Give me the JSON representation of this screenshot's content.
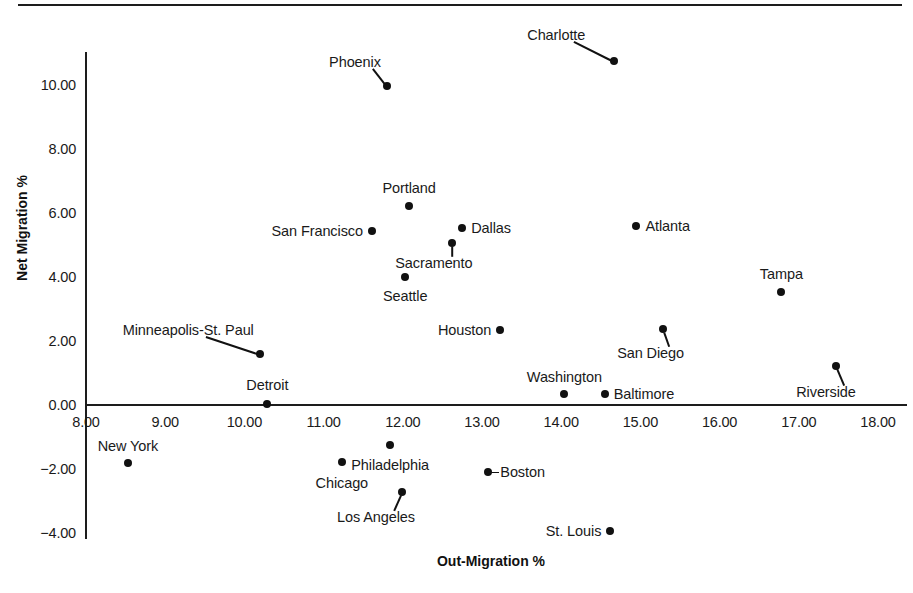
{
  "figure": {
    "title": "",
    "x_axis_title": "Out-Migration %",
    "y_axis_title": "Net Migration %"
  },
  "axes": {
    "x_ticks": [
      "8.00",
      "9.00",
      "10.00",
      "11.00",
      "12.00",
      "13.00",
      "14.00",
      "15.00",
      "16.00",
      "17.00",
      "18.00"
    ],
    "y_ticks": [
      "10.00",
      "8.00",
      "6.00",
      "4.00",
      "2.00",
      "0.00",
      "-2.00",
      "-4.00"
    ]
  },
  "colors": {
    "ink": "#111111",
    "background": "#ffffff"
  },
  "chart_data": {
    "type": "scatter",
    "title": "",
    "xlabel": "Out-Migration %",
    "ylabel": "Net Migration %",
    "xlim": [
      8.0,
      18.0
    ],
    "ylim": [
      -4.0,
      11.2
    ],
    "grid": false,
    "legend": "none",
    "xticks": [
      8.0,
      9.0,
      10.0,
      11.0,
      12.0,
      13.0,
      14.0,
      15.0,
      16.0,
      17.0,
      18.0
    ],
    "yticks": [
      -4.0,
      -2.0,
      0.0,
      2.0,
      4.0,
      6.0,
      8.0,
      10.0
    ],
    "points": [
      {
        "label": "Charlotte",
        "x": 14.67,
        "y": 10.75,
        "label_pos": "leader",
        "label_dx": -58,
        "label_dy": -26
      },
      {
        "label": "Phoenix",
        "x": 11.8,
        "y": 9.98,
        "label_pos": "leader",
        "label_dx": -32,
        "label_dy": -24
      },
      {
        "label": "Portland",
        "x": 12.08,
        "y": 6.22,
        "label_pos": "above",
        "label_dx": 0,
        "label_dy": -18
      },
      {
        "label": "Atlanta",
        "x": 14.95,
        "y": 5.6,
        "label_pos": "right",
        "label_dx": 9,
        "label_dy": 0
      },
      {
        "label": "Dallas",
        "x": 12.75,
        "y": 5.53,
        "label_pos": "right",
        "label_dx": 9,
        "label_dy": 0
      },
      {
        "label": "San Francisco",
        "x": 11.61,
        "y": 5.44,
        "label_pos": "left",
        "label_dx": -9,
        "label_dy": 0
      },
      {
        "label": "Sacramento",
        "x": 12.62,
        "y": 5.06,
        "label_pos": "leader",
        "label_dx": -18,
        "label_dy": 20
      },
      {
        "label": "Seattle",
        "x": 12.03,
        "y": 4.0,
        "label_pos": "below",
        "label_dx": 0,
        "label_dy": 19
      },
      {
        "label": "Tampa",
        "x": 16.78,
        "y": 3.53,
        "label_pos": "above",
        "label_dx": 0,
        "label_dy": -18
      },
      {
        "label": "San Diego",
        "x": 15.28,
        "y": 2.38,
        "label_pos": "leader",
        "label_dx": -12,
        "label_dy": 24
      },
      {
        "label": "Houston",
        "x": 13.23,
        "y": 2.34,
        "label_pos": "left",
        "label_dx": -9,
        "label_dy": 0
      },
      {
        "label": "Minneapolis-St. Paul",
        "x": 10.2,
        "y": 1.6,
        "label_pos": "leader",
        "label_dx": -72,
        "label_dy": -24
      },
      {
        "label": "Riverside",
        "x": 17.47,
        "y": 1.22,
        "label_pos": "leader",
        "label_dx": -10,
        "label_dy": 26
      },
      {
        "label": "Baltimore",
        "x": 14.55,
        "y": 0.34,
        "label_pos": "right",
        "label_dx": 9,
        "label_dy": 0
      },
      {
        "label": "Washington",
        "x": 14.04,
        "y": 0.34,
        "label_pos": "above",
        "label_dx": 0,
        "label_dy": -17
      },
      {
        "label": "Detroit",
        "x": 10.29,
        "y": 0.03,
        "label_pos": "above",
        "label_dx": 0,
        "label_dy": -19
      },
      {
        "label": "Philadelphia",
        "x": 11.84,
        "y": -1.25,
        "label_pos": "below",
        "label_dx": 0,
        "label_dy": 20
      },
      {
        "label": "Chicago",
        "x": 11.23,
        "y": -1.77,
        "label_pos": "below",
        "label_dx": 0,
        "label_dy": 21
      },
      {
        "label": "New York",
        "x": 8.53,
        "y": -1.8,
        "label_pos": "above",
        "label_dx": 0,
        "label_dy": -17
      },
      {
        "label": "Boston",
        "x": 13.08,
        "y": -2.08,
        "label_pos": "right",
        "label_dx": 12,
        "label_dy": 0
      },
      {
        "label": "Los Angeles",
        "x": 11.99,
        "y": -2.72,
        "label_pos": "leader",
        "label_dx": -26,
        "label_dy": 25
      },
      {
        "label": "St. Louis",
        "x": 14.62,
        "y": -3.94,
        "label_pos": "left",
        "label_dx": -9,
        "label_dy": 0
      }
    ]
  }
}
